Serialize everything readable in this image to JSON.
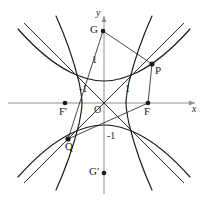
{
  "figure": {
    "background": "#ffffff",
    "stroke": "#1a1a1a",
    "axis_color": "#8c8c8c",
    "width": 207,
    "height": 204,
    "origin_px": [
      104,
      103
    ],
    "unit_px": 22
  },
  "axes": {
    "x_label": "x",
    "y_label": "y",
    "origin_label": "O",
    "x_ticks": [
      {
        "label": "-1",
        "value": -1
      },
      {
        "label": "1",
        "value": 1
      }
    ],
    "y_ticks": [
      {
        "label": "1",
        "value": 1
      },
      {
        "label": "-1",
        "value": -1
      }
    ]
  },
  "points": [
    {
      "name": "G",
      "label": "G",
      "x": -0.05,
      "y": 3.27,
      "px": [
        103,
        31
      ],
      "label_dx": -12,
      "label_dy": -6
    },
    {
      "name": "P",
      "label": "P",
      "x": 2.18,
      "y": 1.77,
      "px": [
        152,
        64
      ],
      "label_dx": 3,
      "label_dy": 1
    },
    {
      "name": "F",
      "label": "F",
      "x": 2.0,
      "y": 0,
      "px": [
        148,
        103
      ],
      "label_dx": -4,
      "label_dy": 3
    },
    {
      "name": "F'",
      "label": "F'",
      "x": -1.77,
      "y": 0,
      "px": [
        65,
        103
      ],
      "label_dx": -5,
      "label_dy": 3
    },
    {
      "name": "Q",
      "label": "Q",
      "x": -1.64,
      "y": -1.64,
      "px": [
        68,
        139
      ],
      "label_dx": -2,
      "label_dy": 2
    },
    {
      "name": "G'",
      "label": "G'",
      "x": -0.05,
      "y": -3.18,
      "px": [
        104,
        173
      ],
      "label_dx": -14,
      "label_dy": -6
    }
  ],
  "tick_labels": [
    {
      "text": "1",
      "px": [
        95,
        60
      ],
      "for": "y-axis-one"
    },
    {
      "text": "-1",
      "px": [
        82,
        89
      ],
      "for": "x-axis-minus-one"
    },
    {
      "text": "1",
      "px": [
        126,
        89
      ],
      "for": "x-axis-one"
    },
    {
      "text": "-1",
      "px": [
        110,
        134
      ],
      "for": "y-axis-minus-one"
    },
    {
      "text": "O",
      "px": [
        94,
        107
      ],
      "for": "origin"
    }
  ],
  "axis_labels": [
    {
      "text": "x",
      "px": [
        192,
        104
      ]
    },
    {
      "text": "y",
      "px": [
        96,
        10
      ]
    }
  ],
  "curves": [
    {
      "name": "hyperbola-up-branch",
      "desc": "upward-opening branch, vertex (0,1)"
    },
    {
      "name": "hyperbola-down-branch",
      "desc": "downward-opening branch, vertex (0,-1)"
    },
    {
      "name": "hyperbola-left-branch",
      "desc": "left-opening branch, vertex (-1,0)"
    },
    {
      "name": "hyperbola-right-branch",
      "desc": "right-opening branch, vertex (1,0)"
    },
    {
      "name": "asymptote-positive",
      "desc": "line y = x"
    },
    {
      "name": "asymptote-negative",
      "desc": "line y = -x"
    }
  ],
  "segments": [
    {
      "name": "segment-G-P",
      "from": "G",
      "to": "P"
    },
    {
      "name": "segment-G-Q",
      "from": "G",
      "to": "Q"
    },
    {
      "name": "segment-Q-F",
      "from": "Q",
      "to": "F"
    },
    {
      "name": "segment-P-F",
      "from": "P",
      "to": "F"
    }
  ]
}
